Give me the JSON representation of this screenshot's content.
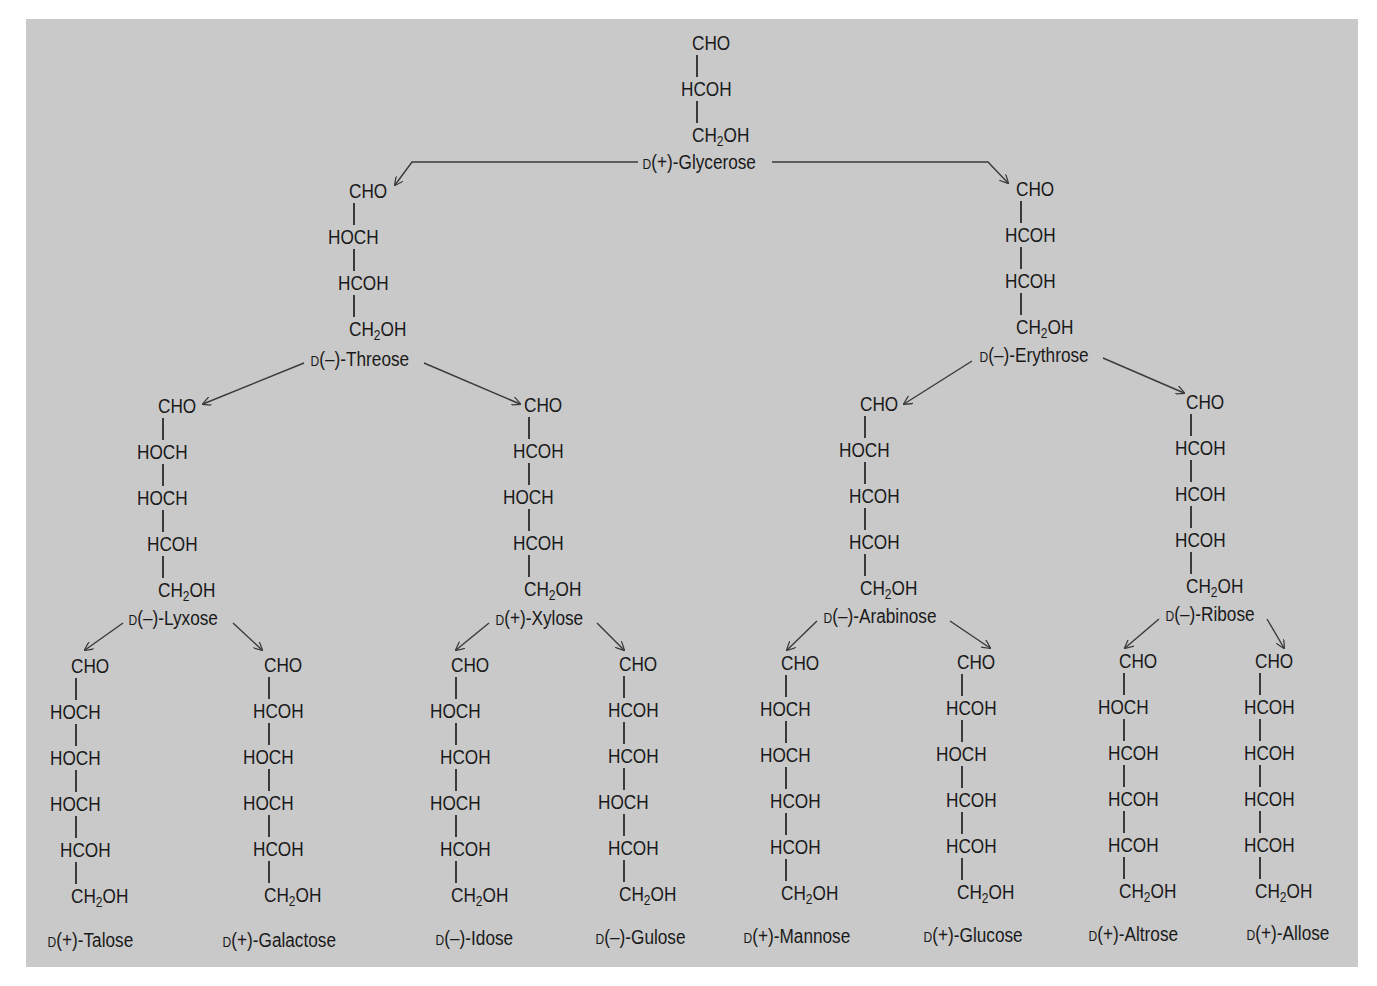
{
  "diagram": {
    "colors": {
      "background": "#c9c9c9",
      "page": "#ffffff",
      "ink": "#1a1a1a",
      "arrow": "#3a3a3a"
    },
    "row_spacing_px": 46,
    "molecules": [
      {
        "id": "glycerose",
        "name": "Glycerose",
        "config": "D",
        "rotation": "(+)",
        "label": "D(+)-Glycerose",
        "x": 697,
        "y": 32,
        "label_x": 640,
        "label_y": 151,
        "groups": [
          "CHO",
          "HCOH",
          "CH2OH"
        ]
      },
      {
        "id": "threose",
        "name": "Threose",
        "config": "D",
        "rotation": "(–)",
        "label": "D(–)-Threose",
        "x": 354,
        "y": 180,
        "label_x": 308,
        "label_y": 348,
        "groups": [
          "CHO",
          "HOCH",
          "HCOH",
          "CH2OH"
        ]
      },
      {
        "id": "erythrose",
        "name": "Erythrose",
        "config": "D",
        "rotation": "(–)",
        "label": "D(–)-Erythrose",
        "x": 1021,
        "y": 178,
        "label_x": 977,
        "label_y": 344,
        "groups": [
          "CHO",
          "HCOH",
          "HCOH",
          "CH2OH"
        ]
      },
      {
        "id": "lyxose",
        "name": "Lyxose",
        "config": "D",
        "rotation": "(–)",
        "label": "D(–)-Lyxose",
        "x": 163,
        "y": 395,
        "label_x": 126,
        "label_y": 607,
        "groups": [
          "CHO",
          "HOCH",
          "HOCH",
          "HCOH",
          "CH2OH"
        ]
      },
      {
        "id": "xylose",
        "name": "Xylose",
        "config": "D",
        "rotation": "(+)",
        "label": "D(+)-Xylose",
        "x": 529,
        "y": 394,
        "label_x": 493,
        "label_y": 607,
        "groups": [
          "CHO",
          "HCOH",
          "HOCH",
          "HCOH",
          "CH2OH"
        ]
      },
      {
        "id": "arabinose",
        "name": "Arabinose",
        "config": "D",
        "rotation": "(–)",
        "label": "D(–)-Arabinose",
        "x": 865,
        "y": 393,
        "label_x": 821,
        "label_y": 605,
        "groups": [
          "CHO",
          "HOCH",
          "HCOH",
          "HCOH",
          "CH2OH"
        ]
      },
      {
        "id": "ribose",
        "name": "Ribose",
        "config": "D",
        "rotation": "(–)",
        "label": "D(–)-Ribose",
        "x": 1191,
        "y": 391,
        "label_x": 1163,
        "label_y": 603,
        "groups": [
          "CHO",
          "HCOH",
          "HCOH",
          "HCOH",
          "CH2OH"
        ]
      },
      {
        "id": "talose",
        "name": "Talose",
        "config": "D",
        "rotation": "(+)",
        "label": "D(+)-Talose",
        "x": 76,
        "y": 655,
        "label_x": 45,
        "label_y": 929,
        "groups": [
          "CHO",
          "HOCH",
          "HOCH",
          "HOCH",
          "HCOH",
          "CH2OH"
        ]
      },
      {
        "id": "galactose",
        "name": "Galactose",
        "config": "D",
        "rotation": "(+)",
        "label": "D(+)-Galactose",
        "x": 269,
        "y": 654,
        "label_x": 220,
        "label_y": 929,
        "groups": [
          "CHO",
          "HCOH",
          "HOCH",
          "HOCH",
          "HCOH",
          "CH2OH"
        ]
      },
      {
        "id": "idose",
        "name": "Idose",
        "config": "D",
        "rotation": "(–)",
        "label": "D(–)-Idose",
        "x": 456,
        "y": 654,
        "label_x": 433,
        "label_y": 927,
        "groups": [
          "CHO",
          "HOCH",
          "HCOH",
          "HOCH",
          "HCOH",
          "CH2OH"
        ]
      },
      {
        "id": "gulose",
        "name": "Gulose",
        "config": "D",
        "rotation": "(–)",
        "label": "D(–)-Gulose",
        "x": 624,
        "y": 653,
        "label_x": 593,
        "label_y": 926,
        "groups": [
          "CHO",
          "HCOH",
          "HCOH",
          "HOCH",
          "HCOH",
          "CH2OH"
        ]
      },
      {
        "id": "mannose",
        "name": "Mannose",
        "config": "D",
        "rotation": "(+)",
        "label": "D(+)-Mannose",
        "x": 786,
        "y": 652,
        "label_x": 741,
        "label_y": 925,
        "groups": [
          "CHO",
          "HOCH",
          "HOCH",
          "HCOH",
          "HCOH",
          "CH2OH"
        ]
      },
      {
        "id": "glucose",
        "name": "Glucose",
        "config": "D",
        "rotation": "(+)",
        "label": "D(+)-Glucose",
        "x": 962,
        "y": 651,
        "label_x": 921,
        "label_y": 924,
        "groups": [
          "CHO",
          "HCOH",
          "HOCH",
          "HCOH",
          "HCOH",
          "CH2OH"
        ]
      },
      {
        "id": "altrose",
        "name": "Altrose",
        "config": "D",
        "rotation": "(+)",
        "label": "D(+)-Altrose",
        "x": 1124,
        "y": 650,
        "label_x": 1086,
        "label_y": 923,
        "groups": [
          "CHO",
          "HOCH",
          "HCOH",
          "HCOH",
          "HCOH",
          "CH2OH"
        ]
      },
      {
        "id": "allose",
        "name": "Allose",
        "config": "D",
        "rotation": "(+)",
        "label": "D(+)-Allose",
        "x": 1260,
        "y": 650,
        "label_x": 1244,
        "label_y": 922,
        "groups": [
          "CHO",
          "HCOH",
          "HCOH",
          "HCOH",
          "HCOH",
          "CH2OH"
        ]
      }
    ],
    "arrows": [
      {
        "from": "glycerose",
        "to": "threose",
        "points": [
          [
            638,
            162
          ],
          [
            412,
            162
          ],
          [
            395,
            185
          ]
        ]
      },
      {
        "from": "glycerose",
        "to": "erythrose",
        "points": [
          [
            772,
            162
          ],
          [
            988,
            162
          ],
          [
            1008,
            183
          ]
        ]
      },
      {
        "from": "threose",
        "to": "lyxose",
        "points": [
          [
            304,
            363
          ],
          [
            203,
            404
          ]
        ]
      },
      {
        "from": "threose",
        "to": "xylose",
        "points": [
          [
            424,
            363
          ],
          [
            520,
            404
          ]
        ]
      },
      {
        "from": "erythrose",
        "to": "arabinose",
        "points": [
          [
            972,
            361
          ],
          [
            904,
            404
          ]
        ]
      },
      {
        "from": "erythrose",
        "to": "ribose",
        "points": [
          [
            1103,
            358
          ],
          [
            1184,
            393
          ]
        ]
      },
      {
        "from": "lyxose",
        "to": "talose",
        "points": [
          [
            123,
            623
          ],
          [
            85,
            650
          ]
        ]
      },
      {
        "from": "lyxose",
        "to": "galactose",
        "points": [
          [
            233,
            623
          ],
          [
            262,
            650
          ]
        ]
      },
      {
        "from": "xylose",
        "to": "idose",
        "points": [
          [
            489,
            623
          ],
          [
            456,
            650
          ]
        ]
      },
      {
        "from": "xylose",
        "to": "gulose",
        "points": [
          [
            597,
            623
          ],
          [
            624,
            650
          ]
        ]
      },
      {
        "from": "arabinose",
        "to": "mannose",
        "points": [
          [
            817,
            621
          ],
          [
            787,
            650
          ]
        ]
      },
      {
        "from": "arabinose",
        "to": "glucose",
        "points": [
          [
            950,
            621
          ],
          [
            990,
            648
          ]
        ]
      },
      {
        "from": "ribose",
        "to": "altrose",
        "points": [
          [
            1159,
            619
          ],
          [
            1125,
            648
          ]
        ]
      },
      {
        "from": "ribose",
        "to": "allose",
        "points": [
          [
            1267,
            619
          ],
          [
            1284,
            648
          ]
        ]
      }
    ]
  }
}
